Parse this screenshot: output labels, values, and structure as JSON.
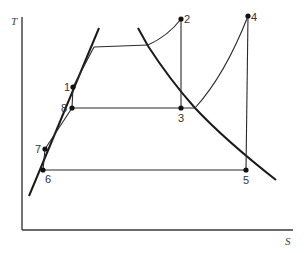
{
  "diagram": {
    "type": "T-s diagram (binary vapour cycle)",
    "axes": {
      "y_label": "T",
      "x_label": "S"
    },
    "points": [
      {
        "id": "1",
        "label": "1",
        "x": 73,
        "y": 87,
        "label_pos": "left"
      },
      {
        "id": "2",
        "label": "2",
        "x": 181,
        "y": 19,
        "label_pos": "right"
      },
      {
        "id": "3",
        "label": "3",
        "x": 181,
        "y": 108,
        "label_pos": "below"
      },
      {
        "id": "4",
        "label": "4",
        "x": 248,
        "y": 16,
        "label_pos": "right"
      },
      {
        "id": "5",
        "label": "5",
        "x": 246,
        "y": 170,
        "label_pos": "below"
      },
      {
        "id": "6",
        "label": "6",
        "x": 43,
        "y": 170,
        "label_pos": "below-right"
      },
      {
        "id": "7",
        "label": "7",
        "x": 45,
        "y": 149,
        "label_pos": "left"
      },
      {
        "id": "8",
        "label": "8",
        "x": 72,
        "y": 108,
        "label_pos": "left"
      }
    ],
    "curves": [
      {
        "name": "saturated-liquid-line"
      },
      {
        "name": "saturated-vapour-line"
      }
    ],
    "processes": [
      "1-top of liquid line (heating)",
      "top plateau (evaporation)",
      "superheat to 2",
      "2-3 expansion",
      "3-8 condensation",
      "8-1 pumping",
      "8-heating-4 via superheat curve",
      "4-5 expansion",
      "5-6 condensation",
      "6-7 pumping",
      "7-8 heating"
    ]
  }
}
